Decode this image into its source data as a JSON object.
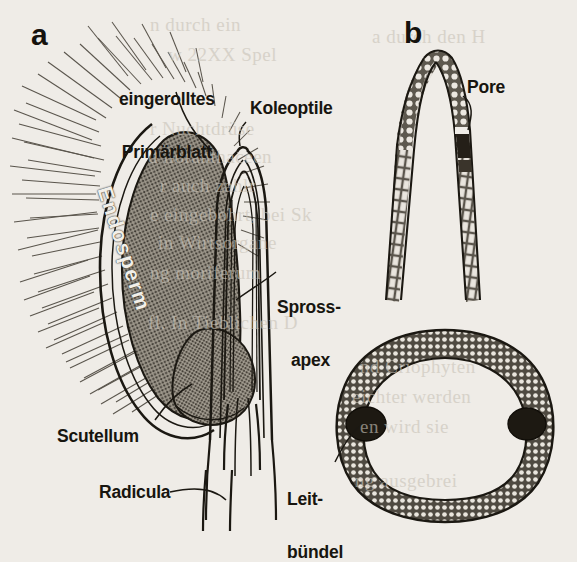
{
  "figure": {
    "kind": "botanical-line-drawing",
    "paper_color": "#efece7",
    "ink_color": "#17150f",
    "endosperm_fill": "#8e887c"
  },
  "panels": [
    {
      "id": "a",
      "letter": "a",
      "caption": "Laengsschnitt durch das keimende Getreidekorn"
    },
    {
      "id": "b",
      "letter": "b",
      "caption": "Koleoptilspitze und Querschnitt"
    }
  ],
  "labels": {
    "panel_a_letter": "a",
    "panel_b_letter": "b",
    "primaerblatt_line1": "eingerolltes",
    "primaerblatt_line2": "Primärblatt",
    "koleoptile": "Koleoptile",
    "sprossapex_line1": "Spross-",
    "sprossapex_line2": "apex",
    "scutellum": "Scutellum",
    "radicula": "Radicula",
    "endosperm": "Endosperm",
    "pore": "Pore",
    "leitbuendel_line1": "Leit-",
    "leitbuendel_line2": "bündel"
  },
  "structures": {
    "seed_coat": "behaarte Samenschale",
    "endosperm": "Endosperm",
    "scutellum": "Scutellum",
    "coleoptile": "Koleoptile",
    "primary_leaf": "eingerolltes Primärblatt",
    "shoot_apex": "Sprossapex",
    "radicula": "Radicula",
    "coleoptile_tip": "Koleoptilspitze",
    "pore": "Pore",
    "cross_section": "Querschnitt der Koleoptile",
    "vascular_bundles_count": 2
  },
  "showthrough": [
    {
      "text": "n durch ein",
      "x": 150,
      "y": 14
    },
    {
      "text": "w 22XX Spel",
      "x": 168,
      "y": 44
    },
    {
      "text": "r Nuchtdrüse",
      "x": 150,
      "y": 118
    },
    {
      "text": "d lloranthaceen",
      "x": 148,
      "y": 146
    },
    {
      "text": "r auch zahlr",
      "x": 160,
      "y": 175
    },
    {
      "text": "e eingebohrt, bei Sk",
      "x": 150,
      "y": 204
    },
    {
      "text": "in Wirtsorgane",
      "x": 158,
      "y": 232
    },
    {
      "text": "ng moriferum",
      "x": 150,
      "y": 262
    },
    {
      "text": "fl. In Tieblichen D",
      "x": 148,
      "y": 312
    },
    {
      "text": "a durch den H",
      "x": 372,
      "y": 26
    },
    {
      "text": "nd Criophyten",
      "x": 360,
      "y": 356
    },
    {
      "text": "eichter werden",
      "x": 352,
      "y": 386
    },
    {
      "text": "en wird sie",
      "x": 360,
      "y": 416
    },
    {
      "text": "ng ausgebrei",
      "x": 355,
      "y": 470
    }
  ]
}
